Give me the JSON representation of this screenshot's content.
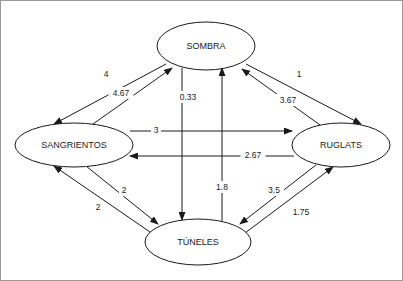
{
  "diagram": {
    "type": "directed-weighted-graph",
    "title": "",
    "nodes": [
      {
        "id": "sombra",
        "label": "SOMBRA",
        "cx": 206,
        "cy": 46,
        "rx": 49,
        "ry": 24
      },
      {
        "id": "sangrientos",
        "label": "SANGRIENTOS",
        "cx": 74,
        "cy": 145,
        "rx": 59,
        "ry": 22
      },
      {
        "id": "ruglats",
        "label": "RUGLATS",
        "cx": 341,
        "cy": 145,
        "rx": 49,
        "ry": 22
      },
      {
        "id": "tuneles",
        "label": "TÚNELES",
        "cx": 198,
        "cy": 242,
        "rx": 53,
        "ry": 23
      }
    ],
    "edges": [
      {
        "id": "e1",
        "from": "sombra",
        "to": "sangrientos",
        "weight": "4",
        "lx": 106,
        "ly": 74,
        "x1": 166,
        "y1": 64,
        "x2": 54,
        "y2": 124
      },
      {
        "id": "e2",
        "from": "sangrientos",
        "to": "sombra",
        "weight": "4.67",
        "lx": 121,
        "ly": 93,
        "x1": 93,
        "y1": 124,
        "x2": 172,
        "y2": 68
      },
      {
        "id": "e3",
        "from": "sombra",
        "to": "ruglats",
        "weight": "1",
        "lx": 299,
        "ly": 74,
        "x1": 246,
        "y1": 64,
        "x2": 361,
        "y2": 124
      },
      {
        "id": "e4",
        "from": "ruglats",
        "to": "sombra",
        "weight": "3.67",
        "lx": 288,
        "ly": 100,
        "x1": 320,
        "y1": 125,
        "x2": 242,
        "y2": 69
      },
      {
        "id": "e5",
        "from": "sombra",
        "to": "tuneles",
        "weight": "0.33",
        "lx": 188,
        "ly": 97,
        "x1": 182,
        "y1": 68,
        "x2": 182,
        "y2": 220
      },
      {
        "id": "e6",
        "from": "tuneles",
        "to": "sombra",
        "weight": "1.8",
        "lx": 222,
        "ly": 187,
        "x1": 222,
        "y1": 221,
        "x2": 222,
        "y2": 68
      },
      {
        "id": "e7",
        "from": "sangrientos",
        "to": "ruglats",
        "weight": "3",
        "lx": 156,
        "ly": 130,
        "x1": 130,
        "y1": 131,
        "x2": 292,
        "y2": 131
      },
      {
        "id": "e8",
        "from": "ruglats",
        "to": "sangrientos",
        "weight": "2.67",
        "lx": 253,
        "ly": 155,
        "x1": 294,
        "y1": 156,
        "x2": 130,
        "y2": 156
      },
      {
        "id": "e9",
        "from": "sangrientos",
        "to": "tuneles",
        "weight": "2",
        "lx": 124,
        "ly": 190,
        "x1": 86,
        "y1": 166,
        "x2": 158,
        "y2": 224
      },
      {
        "id": "e10",
        "from": "tuneles",
        "to": "sangrientos",
        "weight": "2",
        "lx": 98,
        "ly": 207,
        "x1": 150,
        "y1": 232,
        "x2": 54,
        "y2": 166
      },
      {
        "id": "e11",
        "from": "ruglats",
        "to": "tuneles",
        "weight": "3.5",
        "lx": 274,
        "ly": 190,
        "x1": 316,
        "y1": 165,
        "x2": 240,
        "y2": 224
      },
      {
        "id": "e12",
        "from": "tuneles",
        "to": "ruglats",
        "weight": "1.75",
        "lx": 301,
        "ly": 212,
        "x1": 245,
        "y1": 233,
        "x2": 333,
        "y2": 167
      }
    ],
    "colors": {
      "stroke": "#1a1a1a",
      "background": "#ffffff",
      "frame": "#9a9a9a"
    }
  }
}
